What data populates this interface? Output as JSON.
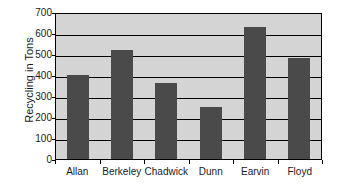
{
  "chart_data": {
    "type": "bar",
    "title": "",
    "subtitle": "",
    "xlabel": "",
    "ylabel": "Recycling in Tons",
    "categories": [
      "Allan",
      "Berkeley",
      "Chadwick",
      "Dunn",
      "Earvin",
      "Floyd"
    ],
    "values": [
      400,
      520,
      360,
      250,
      630,
      480
    ],
    "ylim": [
      0,
      700
    ],
    "ytick_step": 100,
    "yticks": [
      0,
      100,
      200,
      300,
      400,
      500,
      600,
      700
    ],
    "ytick_labels": [
      "0",
      "100",
      "200",
      "300",
      "400",
      "500",
      "600",
      "700"
    ],
    "grid": true,
    "grid_axis": "y",
    "legend": false,
    "legend_position": "none",
    "bar_color": "#4a4a4a",
    "plot_background": "#d4d4d4",
    "page_background": "#ffffff",
    "axis_color": "#000000"
  }
}
